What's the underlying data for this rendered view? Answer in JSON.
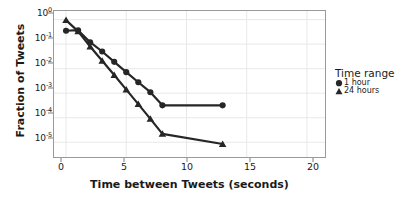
{
  "chart_data": {
    "type": "line",
    "title": "",
    "xlabel": "Time between Tweets (seconds)",
    "ylabel": "Fraction of Tweets",
    "xlim": [
      -1.0,
      21.5
    ],
    "ylim_log10": [
      -5.6,
      0.35
    ],
    "yscale": "log",
    "xscale": "linear",
    "grid": true,
    "legend_position": "right",
    "xticks": [
      0,
      5,
      10,
      15,
      20
    ],
    "xtick_labels": [
      "0",
      "5",
      "10",
      "15",
      "20"
    ],
    "yticks_exponent": [
      0,
      -1,
      -2,
      -3,
      -4,
      -5
    ],
    "ytick_labels": [
      "10^0",
      "10^-1",
      "10^-2",
      "10^-3",
      "10^-4",
      "10^-5"
    ],
    "legend_title": "Time range",
    "series": [
      {
        "name": "1 hour",
        "marker": "circle",
        "color": "#262626",
        "x": [
          0,
          1,
          2,
          3,
          4,
          5,
          6,
          7,
          8,
          13
        ],
        "y": [
          0.35,
          0.37,
          0.12,
          0.05,
          0.019,
          0.0072,
          0.0028,
          0.0011,
          0.00032,
          0.00032
        ]
      },
      {
        "name": "24 hours",
        "marker": "triangle",
        "color": "#262626",
        "x": [
          0,
          1,
          2,
          3,
          4,
          5,
          6,
          7,
          8,
          13
        ],
        "y": [
          0.95,
          0.33,
          0.08,
          0.021,
          0.0055,
          0.0014,
          0.00036,
          9e-05,
          2.2e-05,
          8.5e-06
        ]
      }
    ]
  },
  "legend": {
    "title": "Time range",
    "entries": [
      {
        "label": "1 hour",
        "marker": "circle"
      },
      {
        "label": "24 hours",
        "marker": "triangle"
      }
    ]
  },
  "axes": {
    "x_title": "Time between Tweets (seconds)",
    "y_title": "Fraction of Tweets",
    "x_tick_labels": [
      "0",
      "5",
      "10",
      "15",
      "20"
    ],
    "y_tick_mantissa": [
      "10",
      "10",
      "10",
      "10",
      "10",
      "10"
    ],
    "y_tick_exponent": [
      "0",
      "-1",
      "-2",
      "-3",
      "-4",
      "-5"
    ]
  },
  "colors": {
    "series": "#262626",
    "grid": "#e8e8e8",
    "frame": "#9a9a9a",
    "background": "#ffffff",
    "text": "#1a1a1a"
  }
}
